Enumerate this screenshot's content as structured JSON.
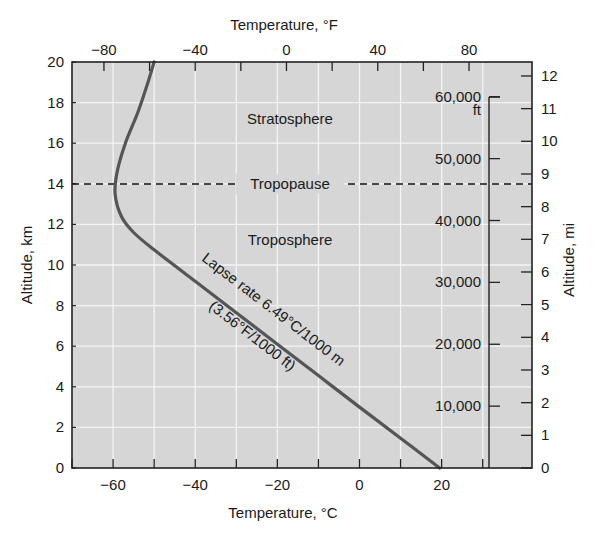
{
  "chart_data": {
    "type": "line",
    "title": "",
    "xlabel": "Temperature, °C",
    "x2label": "Temperature, °F",
    "ylabel": "Altitude, km",
    "y2label": "Altitude, mi",
    "y3label": "ft",
    "xlim": [
      -70,
      42
    ],
    "ylim": [
      0,
      20
    ],
    "grid": true,
    "x_ticks": [
      -60,
      -40,
      -20,
      0,
      20
    ],
    "x_tick_labels": [
      "−60",
      "−40",
      "−20",
      "0",
      "20"
    ],
    "x_minor_ticks": [
      -70,
      -50,
      -30,
      -10,
      10,
      30
    ],
    "x2_ticks_f": [
      -80,
      -40,
      0,
      40,
      80
    ],
    "x2_tick_labels": [
      "−80",
      "−40",
      "0",
      "40",
      "80"
    ],
    "x2_minor_ticks_f": [
      -60,
      -20,
      20,
      60
    ],
    "y_ticks": [
      0,
      2,
      4,
      6,
      8,
      10,
      12,
      14,
      16,
      18,
      20
    ],
    "y2_ticks_mi": [
      0,
      1,
      2,
      3,
      4,
      5,
      6,
      7,
      8,
      9,
      10,
      11,
      12
    ],
    "y3_ticks_ft": [
      10000,
      20000,
      30000,
      40000,
      50000,
      60000
    ],
    "y3_tick_labels": [
      "10,000",
      "20,000",
      "30,000",
      "40,000",
      "50,000",
      "60,000"
    ],
    "series": [
      {
        "name": "Standard atmosphere temperature profile",
        "x": [
          19.5,
          10,
          0,
          -10,
          -20,
          -30,
          -40,
          -50,
          -55,
          -58,
          -59.5,
          -59,
          -57,
          -54,
          -51.5,
          -50
        ],
        "y": [
          0,
          1.47,
          3.0,
          4.55,
          6.1,
          7.65,
          9.2,
          10.75,
          11.6,
          12.4,
          13.5,
          14.6,
          16.0,
          17.5,
          19.0,
          20.0
        ]
      }
    ],
    "annotations": [
      {
        "text": "Stratosphere",
        "x": -5,
        "y": 17.2
      },
      {
        "text": "Tropopause",
        "x": -5,
        "y": 14
      },
      {
        "text": "Troposphere",
        "x": -5,
        "y": 11.2
      },
      {
        "text": "Lapse rate 6.49°C/1000 m",
        "rotation": -38
      },
      {
        "text": "(3.56°F/1000 ft)",
        "rotation": -38
      }
    ],
    "reference_lines": [
      {
        "type": "hline",
        "y": 14,
        "style": "dashed",
        "label": "Tropopause"
      }
    ]
  },
  "labels": {
    "top_axis": "Temperature, °F",
    "bottom_axis": "Temperature, °C",
    "left_axis": "Altitude, km",
    "right_axis": "Altitude, mi",
    "ft_unit": "ft",
    "stratosphere": "Stratosphere",
    "tropopause": "Tropopause",
    "troposphere": "Troposphere",
    "lapse_line1": "Lapse rate 6.49°C/1000 m",
    "lapse_line2": "(3.56°F/1000 ft)"
  },
  "colors": {
    "plot_bg": "#d6d6d6",
    "grid": "#f4f4f4",
    "curve": "#555555",
    "axis": "#222222"
  }
}
